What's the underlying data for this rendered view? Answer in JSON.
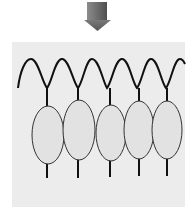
{
  "diagram": {
    "colors": {
      "background": "#ffffff",
      "panel": "#ececec",
      "arrow_light": "#9a9a9a",
      "arrow_dark": "#5a5a5a",
      "line": "#111111",
      "ellipse_fill": "#e2e2e2",
      "ellipse_stroke": "#333333"
    },
    "arrow": {
      "direction": "down",
      "icon": "down-arrow-icon"
    },
    "wave": {
      "peaks": 6,
      "troughs": 5
    },
    "ellipses": [
      {
        "cx": 48,
        "cy": 135,
        "rx": 16,
        "ry": 29,
        "stem_top": 88,
        "stem_bottom": 178
      },
      {
        "cx": 78,
        "cy": 130,
        "rx": 16,
        "ry": 30,
        "stem_top": 88,
        "stem_bottom": 178
      },
      {
        "cx": 111,
        "cy": 133,
        "rx": 15,
        "ry": 28,
        "stem_top": 88,
        "stem_bottom": 177
      },
      {
        "cx": 139,
        "cy": 130,
        "rx": 15,
        "ry": 29,
        "stem_top": 88,
        "stem_bottom": 176
      },
      {
        "cx": 167,
        "cy": 130,
        "rx": 15,
        "ry": 29,
        "stem_top": 88,
        "stem_bottom": 176
      }
    ]
  }
}
